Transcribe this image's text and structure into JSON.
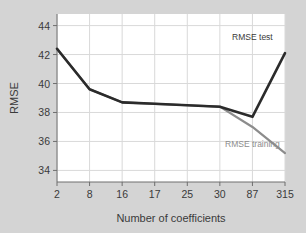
{
  "chart_data": {
    "type": "line",
    "title": "",
    "xlabel": "Number of coefficients",
    "ylabel": "RMSE",
    "categories": [
      "2",
      "8",
      "16",
      "17",
      "25",
      "30",
      "87",
      "315"
    ],
    "xtick_labels": [
      "2",
      "8",
      "16",
      "17",
      "25",
      "30",
      "87",
      "315"
    ],
    "ytick_labels": [
      "34",
      "36",
      "38",
      "40",
      "42",
      "44"
    ],
    "yticks": [
      34,
      36,
      38,
      40,
      42,
      44
    ],
    "ylim": [
      33.2,
      44.8
    ],
    "grid": true,
    "legend_position": "inline-annotations",
    "series": [
      {
        "name": "RMSE test",
        "color": "#2b2b2b",
        "values": [
          42.4,
          39.6,
          38.7,
          38.6,
          38.5,
          38.4,
          37.7,
          42.1
        ]
      },
      {
        "name": "RMSE training",
        "color": "#8c8c8c",
        "values": [
          42.4,
          39.6,
          38.7,
          38.6,
          38.5,
          38.4,
          37.0,
          35.2
        ]
      }
    ],
    "annotations": [
      {
        "text": "RMSE test",
        "category": "87",
        "value": 43.0
      },
      {
        "text": "RMSE training",
        "category": "87",
        "value": 35.6
      }
    ]
  },
  "colors": {
    "figure_background": "#d4d4d4",
    "plot_background": "#ffffff",
    "grid": "#d9d9d9",
    "axis": "#6e6e6e",
    "text": "#3a3a3a",
    "test_series": "#2b2b2b",
    "training_series": "#8c8c8c"
  }
}
